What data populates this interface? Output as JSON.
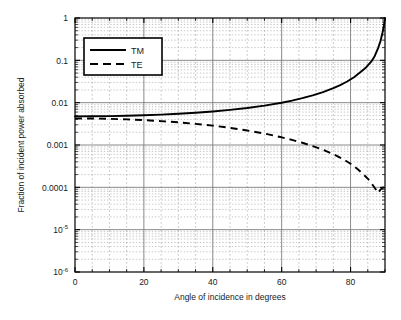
{
  "chart_data": {
    "type": "line",
    "title": "",
    "xlabel": "Angle of incidence in degrees",
    "ylabel": "Fraction of incident power absorbed",
    "xscale": "linear",
    "yscale": "log",
    "xlim": [
      0,
      90
    ],
    "ylim": [
      1e-06,
      1
    ],
    "grid": true,
    "grid_minor": true,
    "legend_position": "upper-left-inside",
    "x_ticks_major": [
      0,
      20,
      40,
      60,
      80
    ],
    "x_ticks_major_labels": [
      "0",
      "20",
      "40",
      "60",
      "80"
    ],
    "x_ticks_minor_step": 5,
    "y_ticks_major": [
      1,
      0.1,
      0.01,
      0.001,
      0.0001,
      1e-05,
      1e-06
    ],
    "y_ticks_major_labels": [
      "1",
      "0.1",
      "0.01",
      "0.001",
      "0.0001",
      "10-5",
      "10-6"
    ],
    "y_tick_labels_display": [
      {
        "text": "1",
        "sup": ""
      },
      {
        "text": "0.1",
        "sup": ""
      },
      {
        "text": "0.01",
        "sup": ""
      },
      {
        "text": "0.001",
        "sup": ""
      },
      {
        "text": "0.0001",
        "sup": ""
      },
      {
        "text": "10",
        "sup": "-5"
      },
      {
        "text": "10",
        "sup": "-6"
      }
    ],
    "series": [
      {
        "name": "TM",
        "style": "solid",
        "color": "#000000",
        "x": [
          0,
          5,
          10,
          15,
          20,
          25,
          30,
          35,
          40,
          45,
          50,
          55,
          60,
          63,
          66,
          69,
          72,
          75,
          77,
          79,
          81,
          83,
          84.5,
          86,
          87,
          88,
          88.7,
          89.3,
          89.7,
          90
        ],
        "y": [
          0.00475,
          0.00477,
          0.00482,
          0.00491,
          0.00504,
          0.00522,
          0.00546,
          0.00578,
          0.0062,
          0.00675,
          0.00749,
          0.00852,
          0.00998,
          0.0112,
          0.0128,
          0.0149,
          0.0178,
          0.022,
          0.026,
          0.0316,
          0.04,
          0.0535,
          0.068,
          0.093,
          0.125,
          0.195,
          0.285,
          0.46,
          0.68,
          1.0
        ]
      },
      {
        "name": "TE",
        "style": "dashed",
        "color": "#000000",
        "x": [
          0,
          5,
          10,
          15,
          20,
          25,
          30,
          35,
          40,
          45,
          50,
          55,
          60,
          63,
          66,
          69,
          72,
          75,
          78,
          80,
          82,
          84,
          85.5,
          87,
          88,
          88.7,
          89.3,
          89.7,
          90
        ],
        "y": [
          0.00425,
          0.00422,
          0.00415,
          0.00403,
          0.00387,
          0.00367,
          0.00343,
          0.00316,
          0.00286,
          0.00254,
          0.0022,
          0.00186,
          0.00152,
          0.00132,
          0.00113,
          0.000945,
          0.000772,
          0.00061,
          0.000456,
          0.00036,
          0.000272,
          0.000193,
          0.000145,
          9.8e-05,
          7.4e-05,
          8.8e-05,
          9.8e-05,
          9.9e-05,
          0.0001
        ]
      }
    ]
  },
  "legend": {
    "entries": [
      {
        "label": "TM",
        "style": "solid"
      },
      {
        "label": "TE",
        "style": "dashed"
      }
    ]
  },
  "axes": {
    "x_label": "Angle of incidence in degrees",
    "y_label": "Fraction of incident power absorbed"
  }
}
